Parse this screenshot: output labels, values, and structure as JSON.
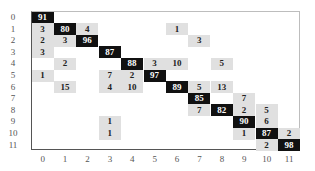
{
  "chart_data": {
    "type": "heatmap",
    "title": "",
    "xlabel": "",
    "ylabel": "",
    "x_tick_labels": [
      "0",
      "1",
      "2",
      "3",
      "4",
      "5",
      "6",
      "7",
      "8",
      "9",
      "10",
      "11"
    ],
    "y_tick_labels": [
      "0",
      "1",
      "2",
      "3",
      "4",
      "5",
      "6",
      "7",
      "8",
      "9",
      "10",
      "11"
    ],
    "colors": {
      "high": "#111111",
      "low": "#e0e0e0",
      "high_text": "#ffffff",
      "low_text": "#222222"
    },
    "dark_threshold": 50,
    "matrix": [
      [
        91,
        0,
        0,
        0,
        0,
        0,
        0,
        0,
        0,
        0,
        0,
        0
      ],
      [
        3,
        80,
        4,
        0,
        0,
        0,
        1,
        0,
        0,
        0,
        0,
        0
      ],
      [
        2,
        3,
        96,
        0,
        0,
        0,
        0,
        3,
        0,
        0,
        0,
        0
      ],
      [
        3,
        0,
        0,
        87,
        0,
        0,
        0,
        0,
        0,
        0,
        0,
        0
      ],
      [
        0,
        2,
        0,
        0,
        88,
        3,
        10,
        0,
        5,
        0,
        0,
        0
      ],
      [
        1,
        0,
        0,
        7,
        2,
        97,
        0,
        0,
        0,
        0,
        0,
        0
      ],
      [
        0,
        15,
        0,
        4,
        10,
        0,
        89,
        5,
        13,
        0,
        0,
        0
      ],
      [
        0,
        0,
        0,
        0,
        0,
        0,
        0,
        85,
        0,
        7,
        0,
        0
      ],
      [
        0,
        0,
        0,
        0,
        0,
        0,
        0,
        7,
        82,
        2,
        5,
        0
      ],
      [
        0,
        0,
        0,
        1,
        0,
        0,
        0,
        0,
        0,
        90,
        6,
        0
      ],
      [
        0,
        0,
        0,
        1,
        0,
        0,
        0,
        0,
        0,
        1,
        87,
        2
      ],
      [
        0,
        0,
        0,
        0,
        0,
        0,
        0,
        0,
        0,
        0,
        2,
        98
      ]
    ],
    "legend": "none",
    "grid": false
  }
}
